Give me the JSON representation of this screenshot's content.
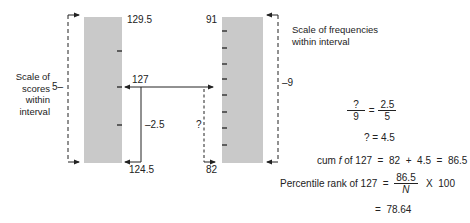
{
  "left_scale": {
    "label_lines": [
      "Scale of",
      "scores",
      "within",
      "interval"
    ],
    "width_label": "5–",
    "top_value": "129.5",
    "bottom_value": "124.5",
    "score_marker": "127",
    "offset_label": "–2.5",
    "tick_count": 3
  },
  "right_scale": {
    "label_lines": [
      "Scale of frequencies",
      "within interval"
    ],
    "width_label": "–9",
    "top_value": "91",
    "bottom_value": "82",
    "unknown_label": "?",
    "tick_count": 8
  },
  "colors": {
    "bar_fill": "#c9c9c9",
    "line": "#222222"
  },
  "equations": {
    "proportion": {
      "lhs_num": "?",
      "lhs_den": "9",
      "eq": "=",
      "rhs_num": "2.5",
      "rhs_den": "5"
    },
    "solve": "? = 4.5",
    "cum_f": {
      "prefix": "cum ",
      "f": "f",
      "rest": " of 127  =  82  +  4.5  =  86.5"
    },
    "percentile": {
      "label": "Percentile rank of 127  = ",
      "num": "86.5",
      "den": "N",
      "times": "  X  100"
    },
    "result": "=  78.64"
  }
}
